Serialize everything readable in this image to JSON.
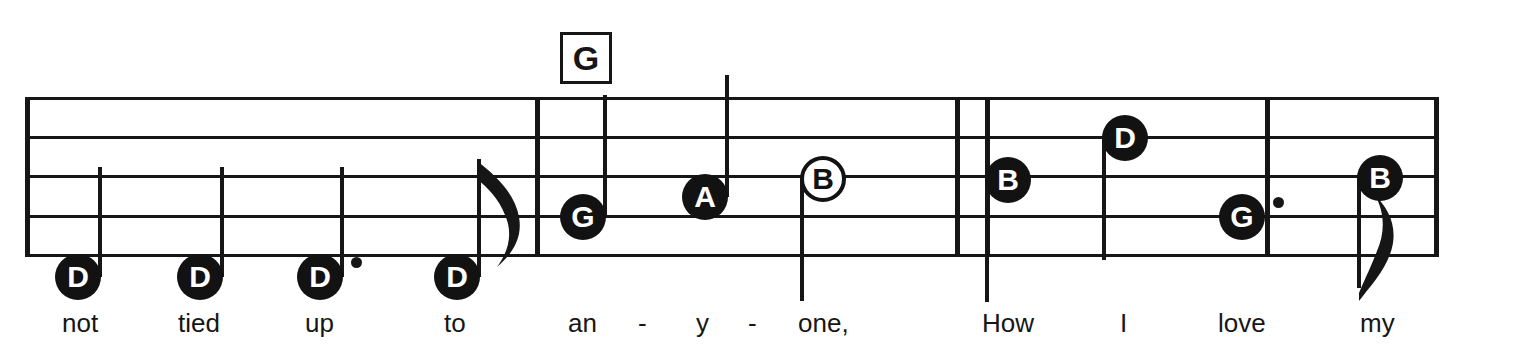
{
  "score": {
    "staff": {
      "left": 25,
      "right": 1439,
      "line_ys": [
        97,
        136,
        175,
        215,
        254
      ],
      "line_thickness": 3
    },
    "barlines": [
      {
        "name": "measure-1-end",
        "x": 535,
        "kind": "single"
      },
      {
        "name": "measure-2-end-a",
        "x": 955,
        "kind": "double-left"
      },
      {
        "name": "measure-2-end-b",
        "x": 985,
        "kind": "double-right"
      },
      {
        "name": "measure-3-end",
        "x": 1265,
        "kind": "single"
      }
    ],
    "chords": [
      {
        "label": "G",
        "x": 560,
        "y": 32,
        "w": 46,
        "h": 46
      }
    ],
    "notes": [
      {
        "id": "n1",
        "letter": "D",
        "x": 78,
        "y": 277,
        "head": "filled",
        "stem": "up",
        "stem_len": 110,
        "dotted": false,
        "flag": false,
        "lyric": "not"
      },
      {
        "id": "n2",
        "letter": "D",
        "x": 200,
        "y": 277,
        "head": "filled",
        "stem": "up",
        "stem_len": 110,
        "dotted": false,
        "flag": false,
        "lyric": "tied"
      },
      {
        "id": "n3",
        "letter": "D",
        "x": 320,
        "y": 277,
        "head": "filled",
        "stem": "up",
        "stem_len": 110,
        "dotted": true,
        "flag": false,
        "lyric": "up"
      },
      {
        "id": "n4",
        "letter": "D",
        "x": 457,
        "y": 277,
        "head": "filled",
        "stem": "up",
        "stem_len": 118,
        "dotted": false,
        "flag": true,
        "lyric": "to"
      },
      {
        "id": "n5",
        "letter": "G",
        "x": 583,
        "y": 217,
        "head": "filled",
        "stem": "up",
        "stem_len": 122,
        "dotted": false,
        "flag": false,
        "lyric": "an"
      },
      {
        "id": "n6",
        "letter": "A",
        "x": 705,
        "y": 197,
        "head": "filled",
        "stem": "up",
        "stem_len": 122,
        "dotted": false,
        "flag": false,
        "lyric": "y"
      },
      {
        "id": "n7",
        "letter": "B",
        "x": 823,
        "y": 179,
        "head": "hollow",
        "stem": "down",
        "stem_len": 122,
        "dotted": false,
        "flag": false,
        "lyric": "one,"
      },
      {
        "id": "n8",
        "letter": "B",
        "x": 1008,
        "y": 180,
        "head": "filled",
        "stem": "down",
        "stem_len": 122,
        "dotted": false,
        "flag": false,
        "lyric": "How"
      },
      {
        "id": "n9",
        "letter": "D",
        "x": 1125,
        "y": 138,
        "head": "filled",
        "stem": "down",
        "stem_len": 122,
        "dotted": false,
        "flag": false,
        "lyric": "I"
      },
      {
        "id": "n10",
        "letter": "G",
        "x": 1242,
        "y": 217,
        "head": "filled",
        "stem": "none",
        "stem_len": 0,
        "dotted": true,
        "flag": false,
        "lyric": "love"
      },
      {
        "id": "n11",
        "letter": "B",
        "x": 1380,
        "y": 178,
        "head": "filled",
        "stem": "down",
        "stem_len": 110,
        "dotted": false,
        "flag": true,
        "lyric": "my"
      }
    ],
    "lyrics": [
      {
        "text": "not",
        "x": 62,
        "y": 310
      },
      {
        "text": "tied",
        "x": 178,
        "y": 310
      },
      {
        "text": "up",
        "x": 305,
        "y": 310
      },
      {
        "text": "to",
        "x": 444,
        "y": 310
      },
      {
        "text": "an",
        "x": 568,
        "y": 310
      },
      {
        "text": "-",
        "x": 638,
        "y": 310
      },
      {
        "text": "y",
        "x": 696,
        "y": 310
      },
      {
        "text": "-",
        "x": 748,
        "y": 310
      },
      {
        "text": "one,",
        "x": 798,
        "y": 310
      },
      {
        "text": "How",
        "x": 982,
        "y": 310
      },
      {
        "text": "I",
        "x": 1120,
        "y": 310
      },
      {
        "text": "love",
        "x": 1218,
        "y": 310
      },
      {
        "text": "my",
        "x": 1360,
        "y": 310
      }
    ],
    "colors": {
      "ink": "#161616",
      "paper": "#ffffff"
    }
  }
}
